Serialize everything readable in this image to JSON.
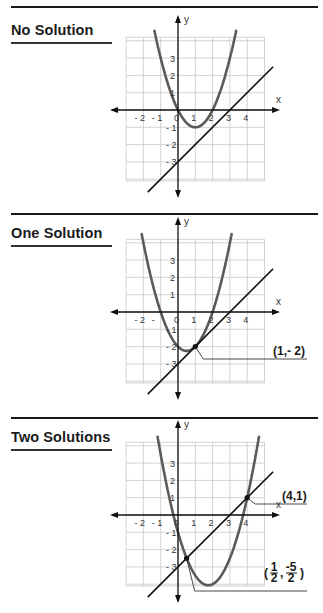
{
  "panels": [
    {
      "title": "No Solution",
      "top": 0,
      "rule_y": 6,
      "title_y": 22,
      "underline_y": 42,
      "graph_origin_y": 110,
      "parabola": {
        "a": 1,
        "b": -2,
        "c": 0
      },
      "line": {
        "m": 1,
        "k": -3
      },
      "solutions": [],
      "x_ticks": [
        "- 2",
        "- 1",
        "0",
        "1",
        "2",
        "3",
        "4"
      ],
      "y_ticks": [
        "3",
        "2",
        "1",
        "- 1",
        "- 2",
        "- 3"
      ]
    },
    {
      "title": "One Solution",
      "top": 0,
      "rule_y": 213,
      "title_y": 225,
      "underline_y": 245,
      "graph_origin_y": 312,
      "parabola": {
        "a": 1,
        "b": -1,
        "c": -2
      },
      "line": {
        "m": 1,
        "k": -3
      },
      "solutions": [
        {
          "x": 1,
          "y": -2,
          "label": "(1,- 2)",
          "callout_y": 359,
          "label_x": 273,
          "label_y": 355
        }
      ],
      "x_ticks": [
        "- 2",
        "-",
        "0",
        "1",
        "2",
        "3",
        "4"
      ],
      "y_ticks": [
        "3",
        "2",
        "1",
        "- 1",
        "- 2",
        "- 3"
      ]
    },
    {
      "title": "Two Solutions",
      "top": 0,
      "rule_y": 417,
      "title_y": 429,
      "underline_y": 449,
      "graph_origin_y": 515,
      "parabola": {
        "a": 1,
        "b": -3.5,
        "c": -1
      },
      "line": {
        "m": 1,
        "k": -3
      },
      "solutions": [
        {
          "x": 4,
          "y": 1,
          "label": "(4,1)",
          "callout_y": 504,
          "label_x": 282,
          "label_y": 500
        },
        {
          "x": 0.5,
          "y": -2.5,
          "label": "(1/2, -5/2)",
          "fraction": {
            "num1": "1",
            "den1": "2",
            "num2": "-5",
            "den2": "2"
          },
          "callout_y": 591,
          "label_x": 264,
          "label_y": 577
        }
      ],
      "x_ticks": [
        "- 2",
        "- 1",
        "0",
        "1",
        "2",
        "3",
        "4"
      ],
      "y_ticks": [
        "3",
        "2",
        "1",
        "- 1",
        "- 2",
        "- 3"
      ]
    }
  ],
  "axes": {
    "x_label": "x",
    "y_label": "y"
  },
  "colors": {
    "curve": "#5a5a5a",
    "line": "#111111",
    "grid": "#c8c8c8",
    "axis": "#111111"
  },
  "chart_data": [
    {
      "type": "line",
      "title": "No Solution",
      "xlabel": "x",
      "ylabel": "y",
      "series": [
        {
          "name": "parabola",
          "equation": "y = x^2 - 2x"
        },
        {
          "name": "line",
          "equation": "y = x - 3"
        }
      ],
      "intersections": [],
      "xlim": [
        -3,
        5
      ],
      "ylim": [
        -4,
        4
      ],
      "grid": true
    },
    {
      "type": "line",
      "title": "One Solution",
      "xlabel": "x",
      "ylabel": "y",
      "series": [
        {
          "name": "parabola",
          "equation": "y = x^2 - x - 2"
        },
        {
          "name": "line",
          "equation": "y = x - 3"
        }
      ],
      "intersections": [
        [
          1,
          -2
        ]
      ],
      "annotations": [
        "(1,- 2)"
      ],
      "xlim": [
        -3,
        5
      ],
      "ylim": [
        -4,
        4
      ],
      "grid": true
    },
    {
      "type": "line",
      "title": "Two Solutions",
      "xlabel": "x",
      "ylabel": "y",
      "series": [
        {
          "name": "parabola",
          "equation": "y = x^2 - 3.5x - 1"
        },
        {
          "name": "line",
          "equation": "y = x - 3"
        }
      ],
      "intersections": [
        [
          0.5,
          -2.5
        ],
        [
          4,
          1
        ]
      ],
      "annotations": [
        "(4,1)",
        "(1/2, -5/2)"
      ],
      "xlim": [
        -3,
        5
      ],
      "ylim": [
        -4,
        4
      ],
      "grid": true
    }
  ]
}
